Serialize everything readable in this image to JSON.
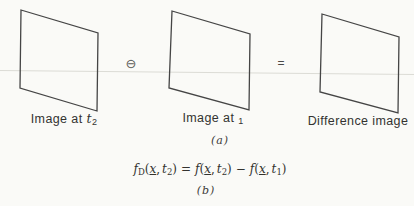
{
  "figure": {
    "colors": {
      "background": "#fafaf7",
      "frame_stroke": "#454545",
      "faint_rule": "#dcdcd6",
      "text": "#2f2f2f"
    },
    "panel_a": {
      "image1": {
        "prefix": "Image at ",
        "var": "t",
        "sub": "2"
      },
      "operator_minus": "⊖",
      "image2": {
        "prefix": "Image at ",
        "sub": "1"
      },
      "operator_equals": "=",
      "image3": {
        "label": "Difference image"
      },
      "caption": "(a)"
    },
    "panel_b": {
      "formula": {
        "f": "f",
        "sub_D": "D",
        "open": "(",
        "x": "x",
        "comma": ",",
        "t": "t",
        "sub2": "2",
        "sub1": "1",
        "close": ")",
        "equals": "=",
        "minus": "−"
      },
      "caption": "(b)"
    },
    "icons": {
      "circled_minus_icon": "⊖"
    }
  }
}
